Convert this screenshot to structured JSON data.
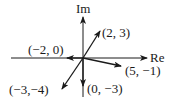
{
  "diagram": {
    "type": "complex-plane-vectors",
    "axes": {
      "x_label": "Re",
      "y_label": "Im"
    },
    "colors": {
      "line": "#1a1a1a",
      "background": "#ffffff"
    },
    "vectors": [
      {
        "label": "(2, 3)",
        "re": 2,
        "im": 3
      },
      {
        "label": "(−2, 0)",
        "re": -2,
        "im": 0
      },
      {
        "label": "(5, −1)",
        "re": 5,
        "im": -1
      },
      {
        "label": "(−3,−4)",
        "re": -3,
        "im": -4
      },
      {
        "label": "(0, −3)",
        "re": 0,
        "im": -3
      }
    ]
  }
}
